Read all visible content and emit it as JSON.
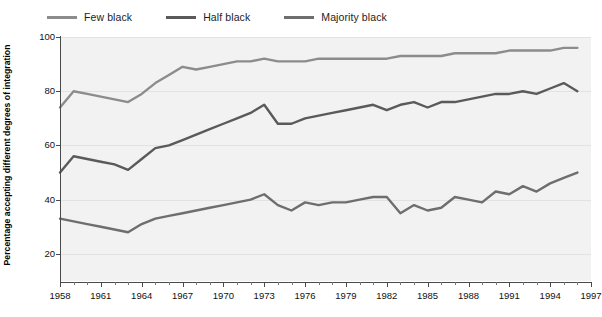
{
  "chart_data": {
    "type": "line",
    "title": "",
    "subtitle": "",
    "xlabel": "",
    "ylabel": "Percentage accepting different degrees of integration",
    "xlim": [
      1958,
      1997
    ],
    "ylim": [
      10,
      100
    ],
    "yticks": [
      20,
      40,
      60,
      80,
      100
    ],
    "xticks": [
      1958,
      1961,
      1964,
      1967,
      1970,
      1973,
      1976,
      1979,
      1982,
      1985,
      1988,
      1991,
      1994,
      1997
    ],
    "grid": true,
    "legend_position": "top-left",
    "x": [
      1958,
      1959,
      1960,
      1961,
      1962,
      1963,
      1964,
      1965,
      1966,
      1967,
      1968,
      1969,
      1970,
      1971,
      1972,
      1973,
      1974,
      1975,
      1976,
      1977,
      1978,
      1979,
      1980,
      1981,
      1982,
      1983,
      1984,
      1985,
      1986,
      1987,
      1988,
      1989,
      1990,
      1991,
      1992,
      1993,
      1994,
      1995,
      1996
    ],
    "series": [
      {
        "name": "Few black",
        "color": "#8c8c8c",
        "values": [
          74,
          80,
          79,
          78,
          77,
          76,
          79,
          83,
          86,
          89,
          88,
          89,
          90,
          91,
          91,
          92,
          91,
          91,
          91,
          92,
          92,
          92,
          92,
          92,
          92,
          93,
          93,
          93,
          93,
          94,
          94,
          94,
          94,
          95,
          95,
          95,
          95,
          96,
          96
        ]
      },
      {
        "name": "Half black",
        "color": "#5a5a5a",
        "values": [
          50,
          56,
          55,
          54,
          53,
          51,
          55,
          59,
          60,
          62,
          64,
          66,
          68,
          70,
          72,
          75,
          68,
          68,
          70,
          71,
          72,
          73,
          74,
          75,
          73,
          75,
          76,
          74,
          76,
          76,
          77,
          78,
          79,
          79,
          80,
          79,
          81,
          83,
          80
        ]
      },
      {
        "name": "Majority black",
        "color": "#6e6e6e",
        "values": [
          33,
          32,
          31,
          30,
          29,
          28,
          31,
          33,
          34,
          35,
          36,
          37,
          38,
          39,
          40,
          42,
          38,
          36,
          39,
          38,
          39,
          39,
          40,
          41,
          41,
          35,
          38,
          36,
          37,
          41,
          40,
          39,
          43,
          42,
          45,
          43,
          46,
          48,
          50
        ]
      }
    ]
  },
  "legend": {
    "items": [
      {
        "label": "Few black"
      },
      {
        "label": "Half black"
      },
      {
        "label": "Majority black"
      }
    ]
  },
  "axis": {
    "ylabel": "Percentage accepting different degrees of integration",
    "ytick_labels": [
      "100",
      "80",
      "60",
      "40",
      "20"
    ],
    "xtick_labels": [
      "1958",
      "1961",
      "1964",
      "1967",
      "1970",
      "1973",
      "1976",
      "1979",
      "1982",
      "1985",
      "1988",
      "1991",
      "1994",
      "1997"
    ]
  }
}
